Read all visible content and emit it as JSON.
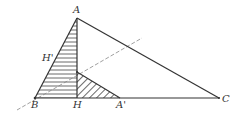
{
  "diagram": {
    "points": {
      "A": {
        "label": "A",
        "x": 77,
        "y": 18
      },
      "B": {
        "label": "B",
        "x": 35,
        "y": 98
      },
      "C": {
        "label": "C",
        "x": 219,
        "y": 98
      },
      "H": {
        "label": "H",
        "x": 77,
        "y": 98
      },
      "A_prime": {
        "label": "A'",
        "x": 120,
        "y": 98
      },
      "H_prime": {
        "label": "H'",
        "x": 56,
        "y": 58
      },
      "P": {
        "x": 77,
        "y": 72
      }
    },
    "segments": [
      "AB",
      "AC",
      "BC",
      "AH",
      "PA'"
    ],
    "dashed_line": {
      "from": [
        17,
        110
      ],
      "to": [
        142,
        38
      ]
    },
    "regions": [
      {
        "name": "triangle ABH",
        "fill": "horizontal-hatch"
      },
      {
        "name": "triangle PHA'",
        "fill": "diagonal-hatch"
      }
    ],
    "colors": {
      "stroke": "#333333",
      "dashed": "#888888",
      "hatch": "#444444"
    }
  }
}
